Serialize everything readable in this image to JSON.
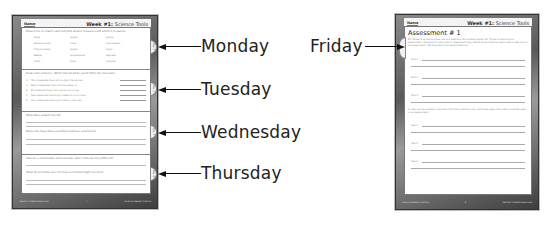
{
  "left_page": {
    "header": {
      "name_label": "Name",
      "week_bold": "Week #1:",
      "week_topic": "Science Tools"
    },
    "sections": [
      {
        "day_tab": "Day 1",
        "prompt": "Draw a line to match each tool with what it measures and which it measures.",
        "words": [
          "Ruler",
          "length",
          "grams",
          "Balance scale",
          "mass",
          "centimeters",
          "Thermometer",
          "length",
          "liters",
          "Beaker",
          "temperature",
          "degrees",
          "Clock",
          "time",
          "minutes"
        ]
      },
      {
        "day_tab": "Day 2",
        "prompt": "Read each sentence. Which tool would be used? Write the tool name.",
        "questions": [
          {
            "num": "1.",
            "text": "Tom measures how tall his plant has grown."
          },
          {
            "num": "2.",
            "text": "Maria measures how cold the water is."
          },
          {
            "num": "3.",
            "text": "Eli measures how much juice is in a cup."
          },
          {
            "num": "4.",
            "text": "Sue measures how long it takes to run a mile."
          },
          {
            "num": "5.",
            "text": "Jack measures how much mass a rock has."
          }
        ]
      },
      {
        "day_tab": "Day 3",
        "prompt_a": "What does a hand lens do?",
        "prompt_b": "Name two ways that a scientist could use a hand lens."
      },
      {
        "day_tab": "Day 4",
        "prompt_a": "How are a microscope and telescope alike? How are they different?",
        "prompt_b": "What do scientists use? Tell how a scientist might use them."
      }
    ],
    "footer": {
      "left": "Teacher Created Resources",
      "center": "7",
      "right": "Science Weekly Practice"
    }
  },
  "right_page": {
    "header": {
      "name_label": "Name",
      "week_bold": "Week #1:",
      "week_topic": "Science Tools"
    },
    "title": "Assessment # 1",
    "intro": "Mr. Torres is an astronomer. He is a scientist who studies space. Mr. Torres is planning an experiment. He wants to use tools to measure things. Name three tools he might use to help him in his experiment. Tell how each tool would help him.",
    "tool_labels": [
      "Tool 1",
      "Tool 2",
      "Tool 3"
    ],
    "mid_prompt": "A ruler can be another important tool that scientists use. List three ways that rulers could be used in an experiment.",
    "use_labels": [
      "Use 1",
      "Use 2",
      "Use 3"
    ],
    "footer": {
      "left": "Science Weekly Practice",
      "center": "8",
      "right": "Teacher Created Resources"
    }
  },
  "callouts": {
    "monday": "Monday",
    "tuesday": "Tuesday",
    "wednesday": "Wednesday",
    "thursday": "Thursday",
    "friday": "Friday"
  }
}
